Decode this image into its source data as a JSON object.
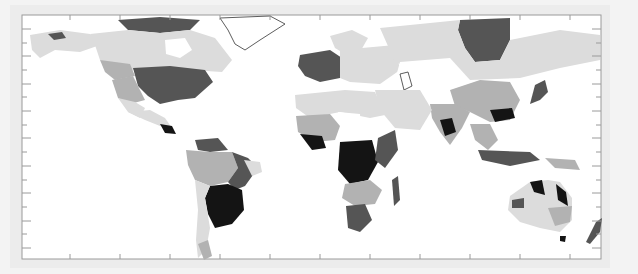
{
  "map": {
    "type": "choropleth",
    "projection": "equirectangular",
    "legend": null,
    "title": null,
    "frame": {
      "x": 22,
      "y": 15,
      "width": 579,
      "height": 244
    },
    "colors": {
      "background_outer": "#ececec",
      "ocean": "#ffffff",
      "class_0": "#ffffff",
      "class_1": "#dcdcdc",
      "class_2": "#b2b2b2",
      "class_3": "#555555",
      "class_4": "#141414",
      "frame": "#9a9a9a",
      "coast": "#333333"
    },
    "x_ticks_px": [
      70,
      120,
      170,
      220,
      270,
      320,
      370,
      420,
      470,
      520,
      570
    ],
    "y_ticks_px": [
      29,
      43,
      56,
      70,
      84,
      97,
      111,
      125,
      138,
      152,
      166,
      180,
      193,
      207,
      221,
      234,
      248
    ],
    "regions": [
      {
        "name": "alaska",
        "class": "class_1",
        "points": "30,35 60,30 90,34 100,45 80,52 55,50 40,58 32,50"
      },
      {
        "name": "alaska-dark",
        "class": "class_3",
        "points": "48,34 62,32 66,38 54,40"
      },
      {
        "name": "canada-arctic-islands",
        "class": "class_3",
        "points": "118,20 160,17 200,20 190,30 160,33 128,30"
      },
      {
        "name": "canada",
        "class": "class_1",
        "points": "90,34 128,30 160,33 190,30 215,38 232,60 222,72 190,70 150,72 120,68 100,60 95,45"
      },
      {
        "name": "hudson-bay",
        "class": "class_0",
        "points": "165,40 185,38 192,50 180,58 166,54"
      },
      {
        "name": "canada-west-mid",
        "class": "class_2",
        "points": "100,60 130,64 135,76 115,80 105,72"
      },
      {
        "name": "eastern-usa",
        "class": "class_3",
        "points": "133,68 170,66 205,70 213,82 195,98 178,100 160,104 148,96 138,86"
      },
      {
        "name": "western-usa",
        "class": "class_2",
        "points": "112,80 133,76 140,90 145,100 130,104 118,98"
      },
      {
        "name": "southwest-usa",
        "class": "class_1",
        "points": "118,98 135,102 145,108 140,118 128,112"
      },
      {
        "name": "mexico",
        "class": "class_1",
        "points": "128,112 150,110 165,118 172,128 160,126 145,120"
      },
      {
        "name": "central-america-dark",
        "class": "class_4",
        "points": "160,124 172,126 176,134 165,133"
      },
      {
        "name": "greenland",
        "class": "class_0",
        "stroke": true,
        "points": "220,18 270,16 285,24 260,40 245,50 235,44 228,30"
      },
      {
        "name": "south-america-north",
        "class": "class_3",
        "points": "195,140 218,138 228,150 210,152 198,150"
      },
      {
        "name": "amazon",
        "class": "class_2",
        "points": "186,150 210,152 232,152 238,168 228,182 210,186 195,180 188,165"
      },
      {
        "name": "brazil-east",
        "class": "class_3",
        "points": "232,152 248,158 258,168 245,186 235,190 228,182 238,168"
      },
      {
        "name": "brazil-northeast",
        "class": "class_1",
        "points": "244,160 260,162 262,172 252,176"
      },
      {
        "name": "brazil-south",
        "class": "class_4",
        "points": "210,186 228,184 242,190 244,210 232,224 215,228 208,214 205,198"
      },
      {
        "name": "andes-chile",
        "class": "class_1",
        "points": "195,180 210,186 205,198 210,228 206,250 198,258 196,240 198,210"
      },
      {
        "name": "patagonia",
        "class": "class_2",
        "points": "198,244 208,240 212,256 204,260"
      },
      {
        "name": "europe-west",
        "class": "class_3",
        "points": "300,55 330,50 345,60 340,78 320,82 305,76 298,66"
      },
      {
        "name": "scandinavia",
        "class": "class_1",
        "points": "330,36 352,30 368,38 360,52 345,54 335,48"
      },
      {
        "name": "europe-east",
        "class": "class_1",
        "points": "340,50 395,45 400,70 380,84 350,82 340,78"
      },
      {
        "name": "siberia-dark",
        "class": "class_3",
        "points": "460,20 510,18 510,40 500,60 475,62 465,48 458,30"
      },
      {
        "name": "russia",
        "class": "class_1",
        "points": "380,28 460,20 458,30 465,48 475,62 500,60 510,40 560,30 600,35 600,60 560,68 520,78 470,80 420,72 395,62"
      },
      {
        "name": "central-asia-white",
        "class": "class_0",
        "points": "400,62 450,58 470,80 440,96 410,94 395,80"
      },
      {
        "name": "caspian",
        "class": "class_0",
        "stroke": true,
        "points": "400,74 408,72 412,86 404,90"
      },
      {
        "name": "china",
        "class": "class_2",
        "points": "450,90 480,80 510,82 520,100 510,120 490,122 470,112 455,106"
      },
      {
        "name": "south-china-dark",
        "class": "class_4",
        "points": "490,110 512,108 515,118 495,122"
      },
      {
        "name": "india",
        "class": "class_2",
        "points": "430,104 455,104 470,112 462,128 450,145 440,132 432,118"
      },
      {
        "name": "india-dark",
        "class": "class_4",
        "points": "440,120 452,118 456,132 445,136"
      },
      {
        "name": "middle-east",
        "class": "class_1",
        "points": "375,90 420,90 432,110 420,130 395,128 380,110"
      },
      {
        "name": "japan",
        "class": "class_3",
        "points": "535,85 545,80 548,92 540,100 530,104"
      },
      {
        "name": "sahara",
        "class": "class_1",
        "points": "295,95 345,90 375,92 385,115 370,118 340,112 310,118 296,108"
      },
      {
        "name": "sahel-west",
        "class": "class_2",
        "points": "296,116 330,114 340,126 335,140 315,142 298,132"
      },
      {
        "name": "sahel-east-white",
        "class": "class_0",
        "points": "338,112 360,114 362,140 345,142 340,126"
      },
      {
        "name": "west-africa-dark",
        "class": "class_4",
        "points": "300,134 322,136 326,148 312,150"
      },
      {
        "name": "central-africa",
        "class": "class_4",
        "points": "340,142 372,140 378,162 368,180 350,184 338,170"
      },
      {
        "name": "east-africa",
        "class": "class_3",
        "points": "378,138 395,130 398,150 385,168 375,160"
      },
      {
        "name": "southern-africa-mid",
        "class": "class_2",
        "points": "345,184 370,180 382,190 375,204 355,206 342,198"
      },
      {
        "name": "south-africa",
        "class": "class_3",
        "points": "346,206 365,204 372,220 360,232 348,228"
      },
      {
        "name": "madagascar",
        "class": "class_3",
        "points": "392,180 398,176 400,200 394,206"
      },
      {
        "name": "southeast-asia",
        "class": "class_2",
        "points": "470,124 490,124 498,140 488,150 475,140"
      },
      {
        "name": "indonesia",
        "class": "class_3",
        "points": "478,150 530,152 540,160 510,166 482,160"
      },
      {
        "name": "new-guinea",
        "class": "class_2",
        "points": "545,158 575,160 580,170 555,168"
      },
      {
        "name": "australia",
        "class": "class_1",
        "points": "510,196 530,182 548,180 560,182 572,198 572,220 560,232 540,228 520,222 508,210"
      },
      {
        "name": "australia-north-dark",
        "class": "class_4",
        "points": "530,182 542,180 545,195 534,192"
      },
      {
        "name": "australia-east-dark",
        "class": "class_4",
        "points": "556,184 566,192 568,206 558,200"
      },
      {
        "name": "australia-southeast",
        "class": "class_2",
        "points": "548,208 572,206 570,222 555,226"
      },
      {
        "name": "australia-west",
        "class": "class_3",
        "points": "512,200 524,198 524,208 512,208"
      },
      {
        "name": "tasmania",
        "class": "class_4",
        "points": "560,236 566,236 565,242 560,241"
      },
      {
        "name": "new-zealand",
        "class": "class_3",
        "points": "596,222 602,218 600,232 590,244 586,242"
      }
    ]
  }
}
